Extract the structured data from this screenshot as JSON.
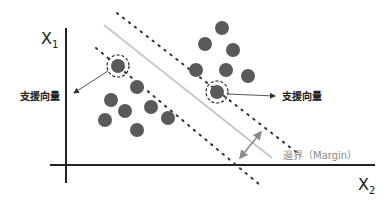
{
  "diagram": {
    "x_axis_label": "X",
    "x_axis_subscript": "2",
    "y_axis_label": "X",
    "y_axis_subscript": "1",
    "support_vector_label_left": "支援向量",
    "support_vector_label_right": "支援向量",
    "margin_label": "邊界（Margin）",
    "colors": {
      "point": "#5a5a5a",
      "axis": "#222222",
      "hyperplane": "#c8c8c8",
      "margin_arrow": "#8a8a8a",
      "margin_text": "#8a8a8a",
      "dotted": "#333333"
    },
    "class_a_count": 7,
    "class_b_count": 7
  }
}
